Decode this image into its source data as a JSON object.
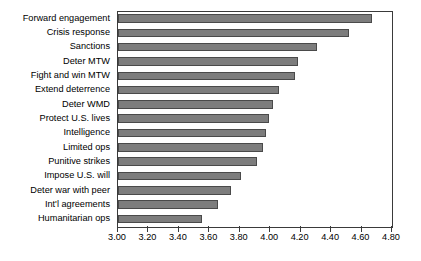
{
  "chart_data": {
    "type": "bar",
    "orientation": "horizontal",
    "title": "",
    "xlabel": "",
    "ylabel": "",
    "xlim": [
      3.0,
      4.8
    ],
    "xticks": [
      "3.00",
      "3.20",
      "3.40",
      "3.60",
      "3.80",
      "4.00",
      "4.20",
      "4.40",
      "4.60",
      "4.80"
    ],
    "xtick_values": [
      3.0,
      3.2,
      3.4,
      3.6,
      3.8,
      4.0,
      4.2,
      4.4,
      4.6,
      4.8
    ],
    "grid": false,
    "legend": null,
    "bar_color": "#7d7d7d",
    "bar_edge_color": "#4a4a4a",
    "categories": [
      "Forward engagement",
      "Crisis response",
      "Sanctions",
      "Deter MTW",
      "Fight and win MTW",
      "Extend deterrence",
      "Deter WMD",
      "Protect U.S. lives",
      "Intelligence",
      "Limited ops",
      "Punitive strikes",
      "Impose U.S. will",
      "Deter war with peer",
      "Int'l agreements",
      "Humanitarian ops"
    ],
    "values": [
      4.67,
      4.52,
      4.31,
      4.18,
      4.16,
      4.06,
      4.02,
      3.99,
      3.97,
      3.95,
      3.91,
      3.81,
      3.74,
      3.66,
      3.55
    ]
  }
}
